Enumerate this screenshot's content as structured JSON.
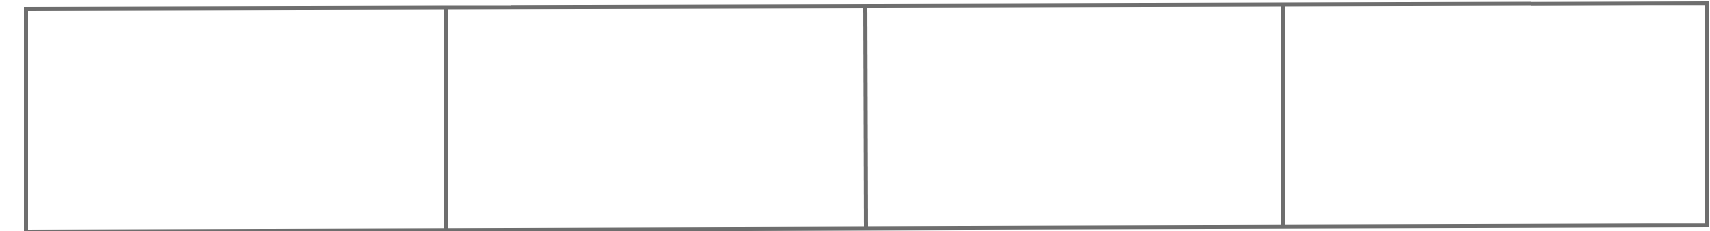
{
  "diagram": {
    "type": "segmented-box",
    "border_color": "#6e6e6e",
    "background_color": "#ffffff",
    "cells": [
      {
        "index": 1,
        "label": ""
      },
      {
        "index": 2,
        "label": ""
      },
      {
        "index": 3,
        "label": ""
      },
      {
        "index": 4,
        "label": ""
      }
    ]
  }
}
